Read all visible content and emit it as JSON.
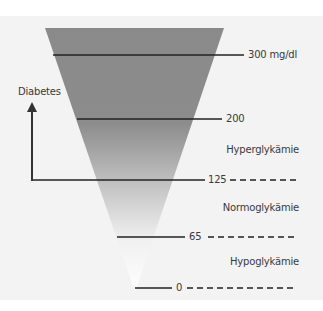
{
  "diagram": {
    "type": "funnel",
    "colors": {
      "funnel_dark": "#8a8a8a",
      "funnel_light": "#ffffff",
      "lines": "#222222",
      "background": "#f3f3f3"
    },
    "arrow_label": "Diabetes",
    "thresholds": [
      {
        "value": "300 mg/dl"
      },
      {
        "value": "200"
      },
      {
        "value": "125"
      },
      {
        "value": "65"
      },
      {
        "value": "0"
      }
    ],
    "zones": [
      {
        "label": "Hyperglykämie"
      },
      {
        "label": "Normoglykämie"
      },
      {
        "label": "Hypoglykämie"
      }
    ]
  }
}
